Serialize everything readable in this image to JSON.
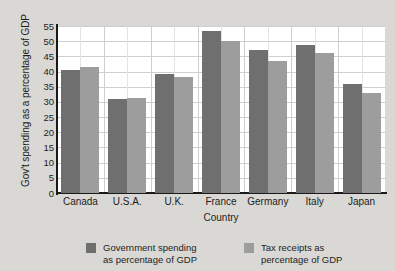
{
  "chart_data": {
    "type": "bar",
    "title": "",
    "xlabel": "Country",
    "ylabel": "Gov't spending as a percentage of GDP",
    "categories": [
      "Canada",
      "U.S.A.",
      "U.K.",
      "France",
      "Germany",
      "Italy",
      "Japan"
    ],
    "series": [
      {
        "name": "Government spending as percentage of GDP",
        "color": "#6f6f6f",
        "values": [
          40.5,
          31.0,
          39.3,
          53.5,
          47.2,
          48.9,
          35.8
        ]
      },
      {
        "name": "Tax receipts as percentage of GDP",
        "color": "#9d9d9d",
        "values": [
          41.5,
          31.2,
          38.3,
          50.2,
          43.5,
          46.0,
          32.8
        ]
      }
    ],
    "ylim": [
      0,
      55
    ],
    "yticks": [
      0,
      5,
      10,
      15,
      20,
      25,
      30,
      35,
      40,
      45,
      50,
      55
    ],
    "ytick_labels": [
      "0",
      "5",
      "10",
      "15",
      "20",
      "25",
      "30",
      "35",
      "40",
      "45",
      "50",
      "55"
    ],
    "grid": true,
    "legend_position": "bottom"
  },
  "legend": {
    "entries": [
      {
        "line1": "Government spending",
        "line2": "as percentage of GDP",
        "color": "#6f6f6f"
      },
      {
        "line1": "Tax receipts as",
        "line2": "percentage of GDP",
        "color": "#9d9d9d"
      }
    ]
  },
  "colors": {
    "background": "#d9d8d4",
    "plot_background": "#ffffff",
    "axis": "#1a1a1a",
    "gridline": "#cfcfcf",
    "series_primary": "#6f6f6f",
    "series_secondary": "#9d9d9d"
  }
}
